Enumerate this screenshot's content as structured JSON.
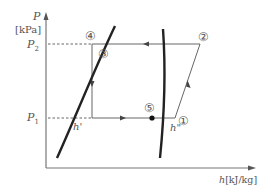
{
  "diagram": {
    "type": "P-h diagram (refrigeration cycle)",
    "y_axis": {
      "symbol": "P",
      "unit": "[kPa]"
    },
    "x_axis": {
      "symbol": "h",
      "unit": "[kJ/kg]"
    },
    "pressure_levels": {
      "high": "P",
      "high_sub": "2",
      "low": "P",
      "low_sub": "1"
    },
    "curve_labels": {
      "sat_liquid": "h'",
      "sat_vapor": "h\""
    },
    "points": [
      {
        "id": "1",
        "label": "①"
      },
      {
        "id": "2",
        "label": "②"
      },
      {
        "id": "3",
        "label": "③"
      },
      {
        "id": "4",
        "label": "④"
      },
      {
        "id": "5",
        "label": "⑤"
      }
    ],
    "colors": {
      "axis": "#777777",
      "curve": "#222222",
      "line": "#555555",
      "text": "#555555"
    }
  }
}
